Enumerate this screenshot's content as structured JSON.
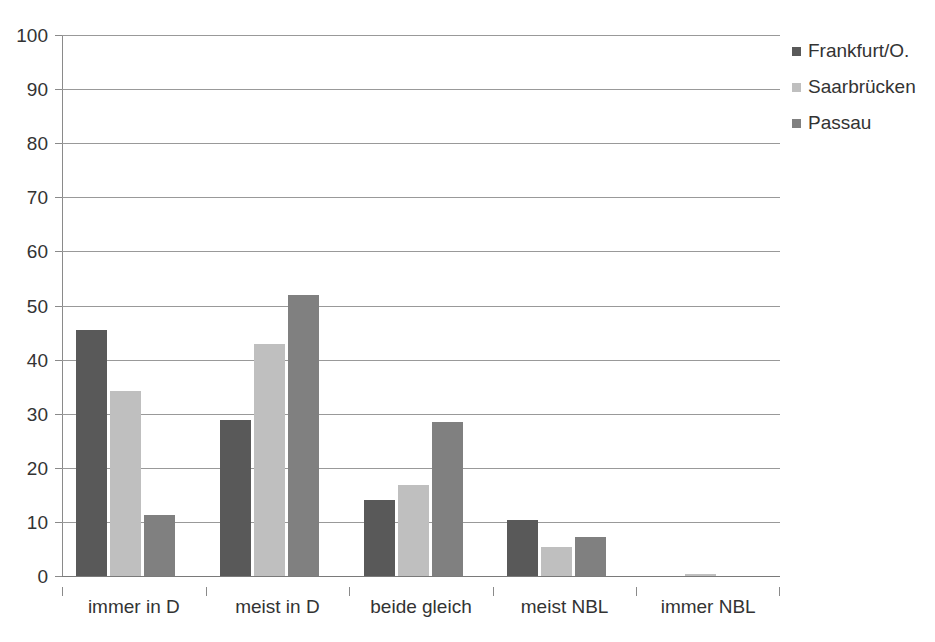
{
  "chart_data": {
    "type": "bar",
    "title": "",
    "xlabel": "",
    "ylabel": "",
    "ylim": [
      0,
      100
    ],
    "yticks": [
      0,
      10,
      20,
      30,
      40,
      50,
      60,
      70,
      80,
      90,
      100
    ],
    "ytick_labels": [
      "0",
      "10",
      "20",
      "30",
      "40",
      "50",
      "60",
      "70",
      "80",
      "90",
      "100"
    ],
    "grid": true,
    "legend_position": "right",
    "categories": [
      "immer in D",
      "meist in D",
      "beide gleich",
      "meist NBL",
      "immer NBL"
    ],
    "series": [
      {
        "name": "Frankfurt/O.",
        "color": "#595959",
        "values": [
          45.4,
          28.8,
          14.1,
          10.3,
          0.0
        ]
      },
      {
        "name": "Saarbrücken",
        "color": "#bfbfbf",
        "values": [
          34.2,
          42.8,
          16.9,
          5.3,
          0.3
        ]
      },
      {
        "name": "Passau",
        "color": "#808080",
        "values": [
          11.3,
          52.0,
          28.4,
          7.3,
          0.0
        ]
      }
    ]
  }
}
